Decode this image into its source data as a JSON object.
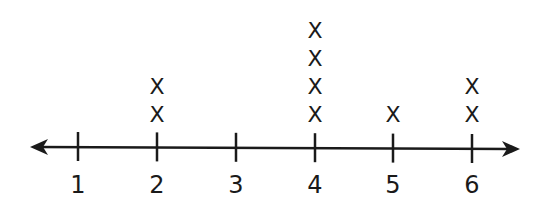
{
  "chart_data": {
    "type": "line_plot",
    "title": "",
    "xlabel": "",
    "ylabel": "",
    "categories": [
      "1",
      "2",
      "3",
      "4",
      "5",
      "6"
    ],
    "values": [
      0,
      2,
      0,
      4,
      1,
      2
    ],
    "marker": "X",
    "xlim": [
      1,
      6
    ],
    "grid": false,
    "legend": null
  },
  "axis": {
    "tick_labels": [
      "1",
      "2",
      "3",
      "4",
      "5",
      "6"
    ],
    "color": "#1a1a1a"
  }
}
